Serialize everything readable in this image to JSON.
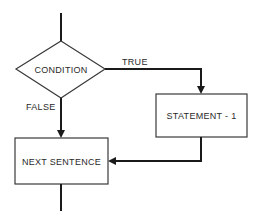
{
  "diagram": {
    "type": "flowchart",
    "nodes": [
      {
        "id": "condition",
        "shape": "diamond",
        "label": "CONDITION"
      },
      {
        "id": "statement1",
        "shape": "rectangle",
        "label": "STATEMENT - 1"
      },
      {
        "id": "next_sentence",
        "shape": "rectangle",
        "label": "NEXT SENTENCE"
      }
    ],
    "edges": [
      {
        "from": "entry",
        "to": "condition",
        "label": ""
      },
      {
        "from": "condition",
        "to": "statement1",
        "label": "TRUE"
      },
      {
        "from": "condition",
        "to": "next_sentence",
        "label": "FALSE"
      },
      {
        "from": "statement1",
        "to": "next_sentence",
        "label": ""
      },
      {
        "from": "next_sentence",
        "to": "exit",
        "label": ""
      }
    ]
  },
  "labels": {
    "condition": "CONDITION",
    "statement1": "STATEMENT - 1",
    "next_sentence": "NEXT SENTENCE",
    "true_edge": "TRUE",
    "false_edge": "FALSE"
  },
  "colors": {
    "line": "#1a1a1a",
    "shape_border": "#3a3a3a",
    "text": "#2a2a2a",
    "background": "#ffffff"
  }
}
